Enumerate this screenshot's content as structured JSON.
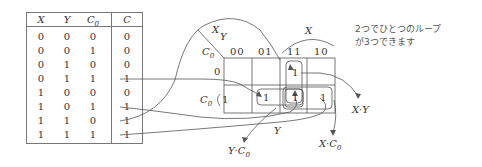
{
  "truth_table": {
    "headers": [
      "X",
      "Y",
      "C0",
      "C"
    ],
    "rows": [
      [
        "0",
        "0",
        "0",
        "0"
      ],
      [
        "0",
        "0",
        "1",
        "0"
      ],
      [
        "0",
        "1",
        "0",
        "0"
      ],
      [
        "0",
        "1",
        "1",
        "1"
      ],
      [
        "1",
        "0",
        "0",
        "0"
      ],
      [
        "1",
        "0",
        "1",
        "1"
      ],
      [
        "1",
        "1",
        "0",
        "1"
      ],
      [
        "1",
        "1",
        "1",
        "1"
      ]
    ]
  },
  "kmap": {
    "corner_top": "X Y",
    "corner_left": "C0",
    "col_headers": [
      "00",
      "01",
      "11",
      "10"
    ],
    "row_headers": [
      "0",
      "1"
    ],
    "row_brace_label": "C0",
    "col_brace_label": "X",
    "cells": [
      [
        "",
        "",
        "1",
        ""
      ],
      [
        "",
        "1",
        "1",
        "1"
      ]
    ],
    "y_label": "Y"
  },
  "loops": [
    "X·Y",
    "Y·C0",
    "X·C0"
  ],
  "note": {
    "line1": "2つでひとつのループ",
    "line2": "が3つできます"
  }
}
